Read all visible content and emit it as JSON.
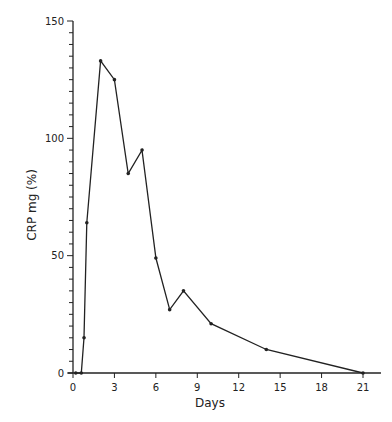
{
  "chart_data": {
    "type": "line",
    "title": "",
    "xlabel": "Days",
    "ylabel": "CRP  mg  (%)",
    "xlim": [
      0,
      22
    ],
    "ylim": [
      0,
      150
    ],
    "x_ticks": [
      0,
      3,
      6,
      9,
      12,
      15,
      18,
      21
    ],
    "y_ticks_labeled": [
      0,
      50,
      100,
      150
    ],
    "y_minor_tick_step": 5,
    "grid": false,
    "legend": null,
    "series": [
      {
        "name": "CRP",
        "x": [
          0.2,
          0.6,
          0.8,
          1,
          2,
          3,
          4,
          5,
          6,
          7,
          8,
          10,
          14,
          21
        ],
        "values": [
          0,
          0,
          15,
          64,
          133,
          125,
          85,
          95,
          49,
          27,
          35,
          21,
          10,
          0
        ]
      }
    ]
  }
}
